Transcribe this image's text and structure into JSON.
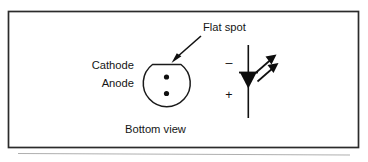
{
  "figure": {
    "name": "led-pinout-and-schematic-symbol",
    "border_color": "#2b2b2b",
    "ink_color": "#151515",
    "background": "#ffffff"
  },
  "labels": {
    "flat_spot": "Flat spot",
    "cathode": "Cathode",
    "anode": "Anode",
    "bottom_view": "Bottom view",
    "minus_sign": "–",
    "plus_sign": "+"
  },
  "package_view": {
    "name": "led-package-bottom-view",
    "description": "Round LED body outline with a flat spot on top and two lead dots",
    "flat_spot_side": "top",
    "leads": [
      {
        "name": "cathode-lead-dot",
        "position": "upper"
      },
      {
        "name": "anode-lead-dot",
        "position": "lower"
      }
    ]
  },
  "schematic_symbol": {
    "name": "led-schematic-symbol",
    "type": "light-emitting-diode",
    "cathode_terminal": "top",
    "anode_terminal": "bottom",
    "emission_arrows": 2,
    "polarity_top": "–",
    "polarity_bottom": "+"
  }
}
